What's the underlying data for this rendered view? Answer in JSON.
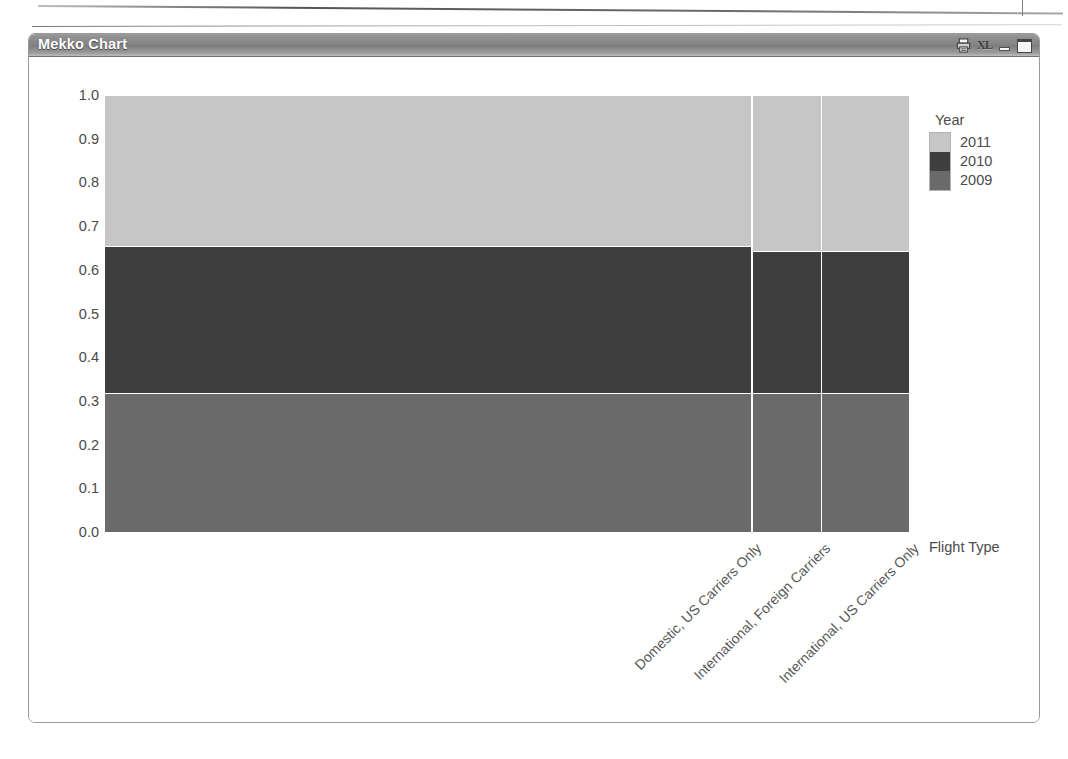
{
  "window": {
    "title": "Mekko Chart",
    "buttons": [
      {
        "name": "print-icon",
        "label": "print"
      },
      {
        "name": "excel-export-icon",
        "label": "XL"
      },
      {
        "name": "minimize-icon",
        "label": "minimize"
      },
      {
        "name": "maximize-icon",
        "label": "maximize"
      }
    ]
  },
  "legend": {
    "title": "Year",
    "entries": [
      {
        "label": "2011",
        "color": "#c6c6c6"
      },
      {
        "label": "2010",
        "color": "#3e3e3e"
      },
      {
        "label": "2009",
        "color": "#6a6a6a"
      }
    ]
  },
  "axes": {
    "x_title": "Flight Type",
    "y_ticks": [
      "1.0",
      "0.9",
      "0.8",
      "0.7",
      "0.6",
      "0.5",
      "0.4",
      "0.3",
      "0.2",
      "0.1",
      "0.0"
    ]
  },
  "chart_data": {
    "type": "bar",
    "subtype": "mekko",
    "title": "Mekko Chart",
    "xlabel": "Flight Type",
    "ylabel": "",
    "ylim": [
      0.0,
      1.0
    ],
    "grid": false,
    "legend_position": "right",
    "legend_title": "Year",
    "categories": [
      "Domestic, US Carriers Only",
      "International, Foreign Carriers",
      "International, US Carriers Only"
    ],
    "category_widths_fraction": [
      0.804,
      0.086,
      0.11
    ],
    "series": [
      {
        "name": "2011",
        "color": "#c6c6c6",
        "values": [
          0.345,
          0.358,
          0.358
        ]
      },
      {
        "name": "2010",
        "color": "#3e3e3e",
        "values": [
          0.337,
          0.325,
          0.325
        ]
      },
      {
        "name": "2009",
        "color": "#6a6a6a",
        "values": [
          0.318,
          0.317,
          0.317
        ]
      }
    ],
    "stack_order_bottom_to_top": [
      "2009",
      "2010",
      "2011"
    ],
    "normalized": true,
    "y_tick_values": [
      0.0,
      0.1,
      0.2,
      0.3,
      0.4,
      0.5,
      0.6,
      0.7,
      0.8,
      0.9,
      1.0
    ]
  }
}
